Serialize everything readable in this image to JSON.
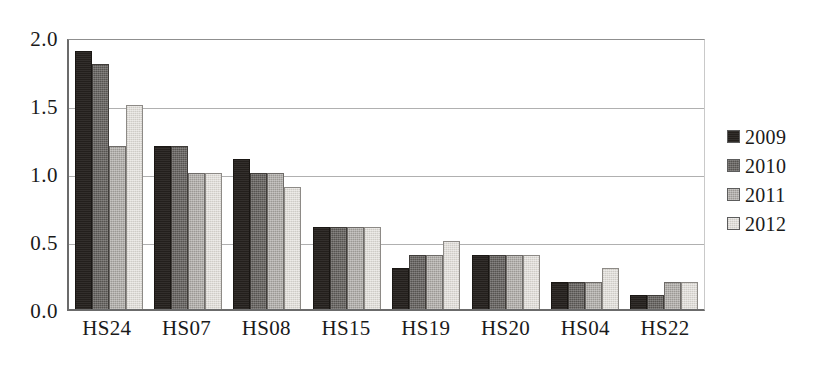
{
  "chart_data": {
    "type": "bar",
    "title": "",
    "xlabel": "",
    "ylabel": "",
    "ylim": [
      0.0,
      2.0
    ],
    "ytick_values": [
      2.0,
      1.5,
      1.0,
      0.5,
      0.0
    ],
    "ytick_labels": [
      "2.0",
      "1.5",
      "1.0",
      "0.5",
      "0.0"
    ],
    "grid": true,
    "grid_axis": "y",
    "legend_position": "right",
    "categories": [
      "HS24",
      "HS07",
      "HS08",
      "HS15",
      "HS19",
      "HS20",
      "HS04",
      "HS22"
    ],
    "series": [
      {
        "name": "2009",
        "color": "#231f1c",
        "values": [
          1.9,
          1.2,
          1.1,
          0.6,
          0.3,
          0.4,
          0.2,
          0.1
        ]
      },
      {
        "name": "2010",
        "color": "#565350",
        "values": [
          1.8,
          1.2,
          1.0,
          0.6,
          0.4,
          0.4,
          0.2,
          0.1
        ]
      },
      {
        "name": "2011",
        "color": "#9b9894",
        "values": [
          1.2,
          1.0,
          1.0,
          0.6,
          0.4,
          0.4,
          0.2,
          0.2
        ]
      },
      {
        "name": "2012",
        "color": "#dedbd6",
        "values": [
          1.5,
          1.0,
          0.9,
          0.6,
          0.5,
          0.4,
          0.3,
          0.2
        ]
      }
    ]
  }
}
